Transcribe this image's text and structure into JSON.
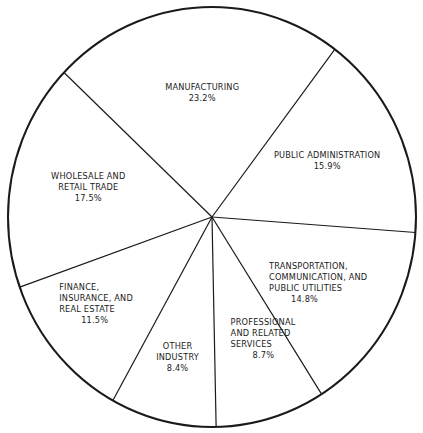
{
  "chart_data": {
    "type": "pie",
    "title": "",
    "start_angle_deg": 37,
    "direction": "clockwise",
    "slices": [
      {
        "label": [
          "PUBLIC ADMINISTRATION"
        ],
        "value": 15.9,
        "value_label": "15.9%"
      },
      {
        "label": [
          "TRANSPORTATION,",
          "COMMUNICATION, AND",
          "PUBLIC UTILITIES"
        ],
        "value": 14.8,
        "value_label": "14.8%"
      },
      {
        "label": [
          "PROFESSIONAL",
          "AND RELATED",
          "SERVICES"
        ],
        "value": 8.7,
        "value_label": "8.7%"
      },
      {
        "label": [
          "OTHER",
          "INDUSTRY"
        ],
        "value": 8.4,
        "value_label": "8.4%"
      },
      {
        "label": [
          "FINANCE,",
          "INSURANCE, AND",
          "REAL ESTATE"
        ],
        "value": 11.5,
        "value_label": "11.5%"
      },
      {
        "label": [
          "WHOLESALE AND",
          "RETAIL TRADE"
        ],
        "value": 17.5,
        "value_label": "17.5%"
      },
      {
        "label": [
          "MANUFACTURING"
        ],
        "value": 23.2,
        "value_label": "23.2%"
      }
    ],
    "colors": {
      "fill": "#ffffff",
      "stroke": "#1a1a1a",
      "text": "#222222"
    }
  }
}
